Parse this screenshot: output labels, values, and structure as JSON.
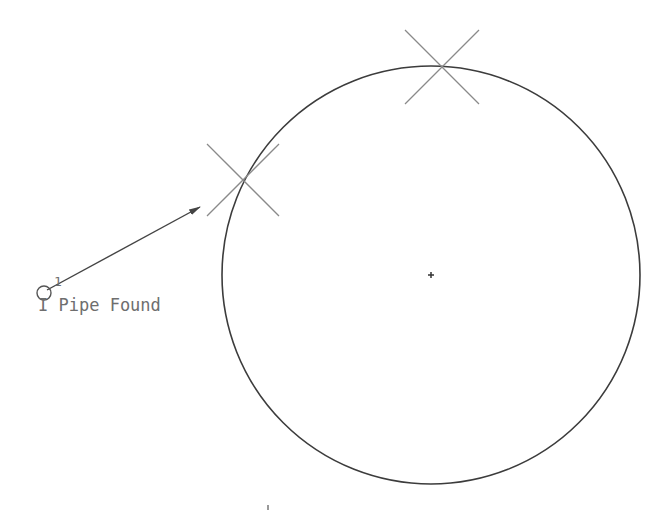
{
  "canvas": {
    "width": 668,
    "height": 512,
    "background": "#ffffff"
  },
  "colors": {
    "circle_stroke": "#3c3c3c",
    "cross_stroke": "#8a8a8a",
    "leader_stroke": "#444444",
    "text": "#6e6e6e"
  },
  "circle": {
    "cx": 431,
    "cy": 275,
    "r": 209
  },
  "center_mark": {
    "x": 431,
    "y": 275,
    "size": 3
  },
  "cross_markers": [
    {
      "name": "top",
      "cx": 442,
      "cy": 67,
      "half": 37
    },
    {
      "name": "left",
      "cx": 243,
      "cy": 180,
      "half": 36
    }
  ],
  "leader": {
    "start": {
      "x": 47,
      "y": 290
    },
    "end": {
      "x": 200,
      "y": 207
    },
    "point_circle": {
      "cx": 44,
      "cy": 293,
      "r": 7
    }
  },
  "annotation": {
    "number": "1",
    "text": "I Pipe Found"
  },
  "tick": {
    "x": 268,
    "y1": 505,
    "y2": 510
  }
}
